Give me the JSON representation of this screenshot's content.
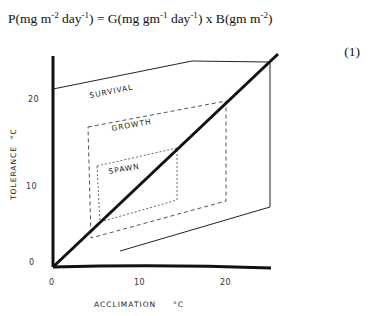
{
  "equation": {
    "lhs": "P(mg m",
    "lhs_sup1": "-2",
    "lhs_mid": " day",
    "lhs_sup2": "-1",
    "eq_mid": ") = G(mg gm",
    "g_sup1": "-1",
    "g_mid": " day",
    "g_sup2": "-1",
    "b_part": ") x B(gm m",
    "b_sup": "-2",
    "close": ")",
    "number": "(1)"
  },
  "diagram": {
    "y_axis_label": "TOLERANCE  °C",
    "x_axis_label": "ACCLIMATION     °C",
    "y_ticks": [
      "0",
      "10",
      "20"
    ],
    "x_ticks": [
      "0",
      "10",
      "20"
    ],
    "regions": {
      "survival": "SURVIVAL",
      "growth": "GROWTH",
      "spawn": "SPAWN"
    },
    "colors": {
      "ink": "#111111",
      "dashed": "#555555",
      "background": "#ffffff"
    }
  }
}
